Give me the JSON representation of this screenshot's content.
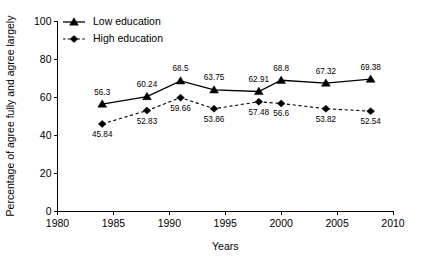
{
  "chart_data": {
    "type": "line",
    "title": "",
    "xlabel": "Years",
    "ylabel": "Percentage of agree fully and agree largely",
    "xlim": [
      1980,
      2010
    ],
    "ylim": [
      0,
      100
    ],
    "xticks": [
      1980,
      1985,
      1990,
      1995,
      2000,
      2005,
      2010
    ],
    "yticks": [
      0,
      20,
      40,
      60,
      80,
      100
    ],
    "xtick_labels": [
      "1980",
      "1985",
      "1990",
      "1995",
      "2000",
      "2005",
      "2010"
    ],
    "ytick_labels": [
      "0",
      "20",
      "40",
      "60",
      "80",
      "100"
    ],
    "grid": false,
    "legend_position": "top-left",
    "x": [
      1984,
      1988,
      1991,
      1994,
      1998,
      2000,
      2004,
      2008
    ],
    "series": [
      {
        "name": "Low education",
        "marker": "triangle",
        "linestyle": "solid",
        "color": "#000000",
        "values": [
          56.3,
          60.24,
          68.5,
          63.75,
          62.91,
          68.8,
          67.32,
          69.38
        ],
        "labels": [
          "56.3",
          "60.24",
          "68.5",
          "63.75",
          "62.91",
          "68.8",
          "67.32",
          "69.38"
        ],
        "label_positions": [
          "above",
          "above",
          "above",
          "above",
          "above",
          "above",
          "above",
          "above"
        ]
      },
      {
        "name": "High education",
        "marker": "diamond",
        "linestyle": "dashed",
        "color": "#000000",
        "values": [
          45.84,
          52.83,
          59.66,
          53.86,
          57.48,
          56.6,
          53.82,
          52.54
        ],
        "labels": [
          "45.84",
          "52.83",
          "59.66",
          "53.86",
          "57.48",
          "56.6",
          "53.82",
          "52.54"
        ],
        "label_positions": [
          "below",
          "below",
          "below",
          "below",
          "below",
          "below",
          "below",
          "below"
        ]
      }
    ]
  },
  "legend": {
    "items": [
      {
        "label": "Low education"
      },
      {
        "label": "High education"
      }
    ]
  },
  "axes": {
    "x_title": "Years",
    "y_title": "Percentage of agree fully and agree largely"
  }
}
